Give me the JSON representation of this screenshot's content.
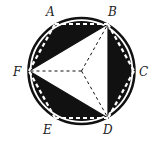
{
  "diagram": {
    "type": "geometry",
    "labels": {
      "A": "A",
      "B": "B",
      "C": "C",
      "D": "D",
      "E": "E",
      "F": "F"
    },
    "colors": {
      "shade": "#111111",
      "background": "#ffffff"
    }
  }
}
